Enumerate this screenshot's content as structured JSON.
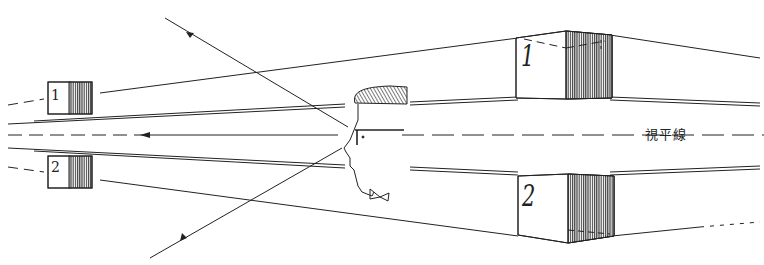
{
  "diagram": {
    "eye_level_label": "視平線",
    "boxes": [
      {
        "id": "small-1",
        "label": "1",
        "position": "left-upper"
      },
      {
        "id": "small-2",
        "label": "2",
        "position": "left-lower"
      },
      {
        "id": "large-1",
        "label": "1",
        "position": "right-upper"
      },
      {
        "id": "large-2",
        "label": "2",
        "position": "right-lower"
      }
    ],
    "colors": {
      "line": "#222222",
      "hatch": "#333333",
      "background": "#ffffff"
    }
  }
}
